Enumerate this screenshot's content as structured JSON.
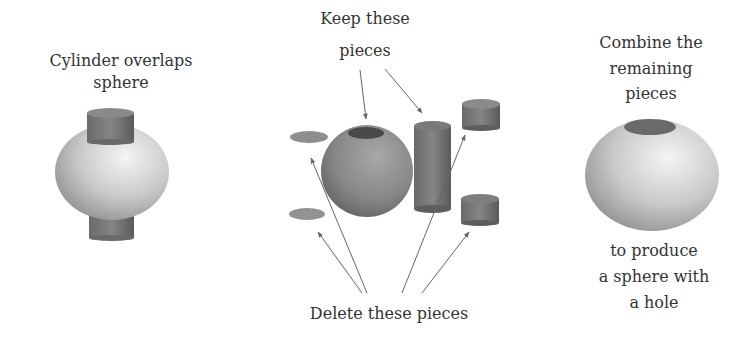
{
  "panels": {
    "left": {
      "caption_line1": "Cylinder overlaps",
      "caption_line2": "sphere"
    },
    "middle": {
      "keep_line1": "Keep these",
      "keep_line2": "pieces",
      "delete_label": "Delete these pieces"
    },
    "right": {
      "caption_line1": "Combine the",
      "caption_line2": "remaining",
      "caption_line3": "pieces",
      "result_line1": "to produce",
      "result_line2": "a sphere with",
      "result_line3": "a hole"
    }
  },
  "colors": {
    "text": "#333333",
    "arrow": "#666666",
    "light_sphere": "#d8d8d8",
    "dark_sphere": "#8a8a8a",
    "cylinder": "#6e6e6e"
  }
}
